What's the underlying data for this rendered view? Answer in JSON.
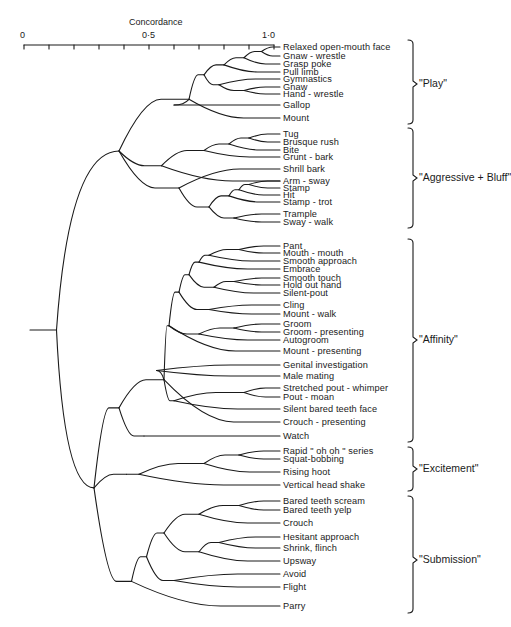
{
  "axis": {
    "title": "Concordance",
    "ticks": [
      "0",
      "0·5",
      "1·0"
    ],
    "range": [
      0,
      1.0
    ],
    "minor_step": 0.1
  },
  "leaves": [
    {
      "label": "Relaxed open-mouth face",
      "y": 47
    },
    {
      "label": "Gnaw - wrestle",
      "y": 56
    },
    {
      "label": "Grasp poke",
      "y": 64
    },
    {
      "label": "Pull limb",
      "y": 72
    },
    {
      "label": "Gymnastics",
      "y": 79
    },
    {
      "label": "Gnaw",
      "y": 87
    },
    {
      "label": "Hand - wrestle",
      "y": 94
    },
    {
      "label": "Gallop",
      "y": 105
    },
    {
      "label": "Mount",
      "y": 118
    },
    {
      "label": "Tug",
      "y": 134
    },
    {
      "label": "Brusque rush",
      "y": 142
    },
    {
      "label": "Bite",
      "y": 150
    },
    {
      "label": "Grunt - bark",
      "y": 157
    },
    {
      "label": "Shrill bark",
      "y": 169
    },
    {
      "label": "Arm - sway",
      "y": 181
    },
    {
      "label": "Stamp",
      "y": 188
    },
    {
      "label": "Hit",
      "y": 195
    },
    {
      "label": "Stamp - trot",
      "y": 202
    },
    {
      "label": "Trample",
      "y": 214
    },
    {
      "label": "Sway - walk",
      "y": 222
    },
    {
      "label": "Pant",
      "y": 246
    },
    {
      "label": "Mouth - mouth",
      "y": 253
    },
    {
      "label": "Smooth approach",
      "y": 261
    },
    {
      "label": "Embrace",
      "y": 269
    },
    {
      "label": "Smooth touch",
      "y": 278
    },
    {
      "label": "Hold out hand",
      "y": 285
    },
    {
      "label": "Silent-pout",
      "y": 293
    },
    {
      "label": "Cling",
      "y": 305
    },
    {
      "label": "Mount - walk",
      "y": 314
    },
    {
      "label": "Groom",
      "y": 324
    },
    {
      "label": "Groom - presenting",
      "y": 332
    },
    {
      "label": "Autogroom",
      "y": 340
    },
    {
      "label": "Mount - presenting",
      "y": 351
    },
    {
      "label": "Genital investigation",
      "y": 365
    },
    {
      "label": "Male mating",
      "y": 376
    },
    {
      "label": "Stretched pout - whimper",
      "y": 388
    },
    {
      "label": "Pout - moan",
      "y": 397
    },
    {
      "label": "Silent bared teeth face",
      "y": 409
    },
    {
      "label": "Crouch - presenting",
      "y": 422
    },
    {
      "label": "Watch",
      "y": 436
    },
    {
      "label": "Rapid \" oh oh \" series",
      "y": 451
    },
    {
      "label": "Squat-bobbing",
      "y": 459
    },
    {
      "label": "Rising hoot",
      "y": 472
    },
    {
      "label": "Vertical head shake",
      "y": 485
    },
    {
      "label": "Bared teeth scream",
      "y": 501
    },
    {
      "label": "Bared teeth yelp",
      "y": 510
    },
    {
      "label": "Crouch",
      "y": 523
    },
    {
      "label": "Hesitant approach",
      "y": 537
    },
    {
      "label": "Shrink, flinch",
      "y": 548
    },
    {
      "label": "Upsway",
      "y": 561
    },
    {
      "label": "Avoid",
      "y": 574
    },
    {
      "label": "Flight",
      "y": 587
    },
    {
      "label": "Parry",
      "y": 606
    }
  ],
  "groups": [
    {
      "label": "\"Play\"",
      "top": 40,
      "bottom": 124,
      "mid": 84
    },
    {
      "label": "\"Aggressive + Bluff\"",
      "top": 128,
      "bottom": 228,
      "mid": 178
    },
    {
      "label": "\"Affinity\"",
      "top": 239,
      "bottom": 442,
      "mid": 340
    },
    {
      "label": "\"Excitement\"",
      "top": 447,
      "bottom": 491,
      "mid": 469
    },
    {
      "label": "\"Submission\"",
      "top": 496,
      "bottom": 613,
      "mid": 560
    }
  ],
  "chart_data": {
    "type": "dendrogram",
    "title": "",
    "xlabel": "Concordance",
    "xlim": [
      0,
      1.0
    ],
    "xticks": [
      0,
      0.5,
      1.0
    ],
    "clusters": [
      {
        "name": "Play",
        "members": [
          "Relaxed open-mouth face",
          "Gnaw-wrestle",
          "Grasp poke",
          "Pull limb",
          "Gymnastics",
          "Gnaw",
          "Hand-wrestle",
          "Gallop",
          "Mount"
        ]
      },
      {
        "name": "Aggressive + Bluff",
        "members": [
          "Tug",
          "Brusque rush",
          "Bite",
          "Grunt-bark",
          "Shrill bark",
          "Arm-sway",
          "Stamp",
          "Hit",
          "Stamp-trot",
          "Trample",
          "Sway-walk"
        ]
      },
      {
        "name": "Affinity",
        "members": [
          "Pant",
          "Mouth-mouth",
          "Smooth approach",
          "Embrace",
          "Smooth touch",
          "Hold out hand",
          "Silent-pout",
          "Cling",
          "Mount-walk",
          "Groom",
          "Groom-presenting",
          "Autogroom",
          "Mount-presenting",
          "Genital investigation",
          "Male mating",
          "Stretched pout-whimper",
          "Pout-moan",
          "Silent bared teeth face",
          "Crouch-presenting",
          "Watch"
        ]
      },
      {
        "name": "Excitement",
        "members": [
          "Rapid \"oh oh\" series",
          "Squat-bobbing",
          "Rising hoot",
          "Vertical head shake"
        ]
      },
      {
        "name": "Submission",
        "members": [
          "Bared teeth scream",
          "Bared teeth yelp",
          "Crouch",
          "Hesitant approach",
          "Shrink, flinch",
          "Upsway",
          "Avoid",
          "Flight",
          "Parry"
        ]
      }
    ],
    "approx_merge_concordance": {
      "play_cluster": 0.66,
      "aggressive_cluster": 0.62,
      "play_plus_aggressive": 0.39,
      "affinity_cluster": 0.55,
      "excitement_cluster": 0.44,
      "affinity_plus_excitement": 0.35,
      "submission_cluster": 0.38,
      "affinity_excitement_plus_submission": 0.3,
      "root": 0.15
    }
  }
}
